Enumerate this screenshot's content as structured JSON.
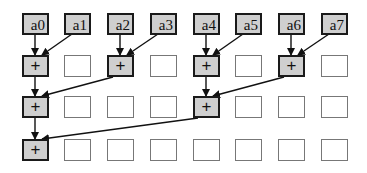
{
  "diagram": {
    "type": "parallel-reduction-tree",
    "inputs": [
      "a0",
      "a1",
      "a2",
      "a3",
      "a4",
      "a5",
      "a6",
      "a7"
    ],
    "operator_symbol": "+",
    "rows": [
      {
        "level": 1,
        "cells": [
          "+",
          "",
          "+",
          "",
          "+",
          "",
          "+",
          ""
        ]
      },
      {
        "level": 2,
        "cells": [
          "+",
          "",
          "",
          "",
          "+",
          "",
          "",
          ""
        ]
      },
      {
        "level": 3,
        "cells": [
          "+",
          "",
          "",
          "",
          "",
          "",
          "",
          ""
        ]
      }
    ],
    "edges": [
      {
        "from": "a0",
        "to": "L1[0]"
      },
      {
        "from": "a1",
        "to": "L1[0]"
      },
      {
        "from": "a2",
        "to": "L1[2]"
      },
      {
        "from": "a3",
        "to": "L1[2]"
      },
      {
        "from": "a4",
        "to": "L1[4]"
      },
      {
        "from": "a5",
        "to": "L1[4]"
      },
      {
        "from": "a6",
        "to": "L1[6]"
      },
      {
        "from": "a7",
        "to": "L1[6]"
      },
      {
        "from": "L1[0]",
        "to": "L2[0]"
      },
      {
        "from": "L1[2]",
        "to": "L2[0]"
      },
      {
        "from": "L1[4]",
        "to": "L2[4]"
      },
      {
        "from": "L1[6]",
        "to": "L2[4]"
      },
      {
        "from": "L2[0]",
        "to": "L3[0]"
      },
      {
        "from": "L2[4]",
        "to": "L3[0]"
      }
    ],
    "colors": {
      "filled_box": "#cfcfcf",
      "border": "#1a1a1a",
      "empty_border": "#777777",
      "background": "#ffffff"
    }
  }
}
